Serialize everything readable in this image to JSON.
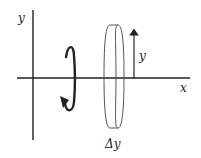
{
  "diagram": {
    "labels": {
      "y_axis": "y",
      "x_axis": "x",
      "radius": "y",
      "thickness": "Δy"
    },
    "colors": {
      "stroke": "#222222",
      "disk_stroke": "#555555",
      "background": "#ffffff"
    },
    "elements": {
      "rotation_arrow": "curved arrow indicating rotation about the y-axis",
      "disk": "thin cylindrical disk",
      "radius_arrow": "vertical arrow from x-axis up to disk edge"
    }
  }
}
